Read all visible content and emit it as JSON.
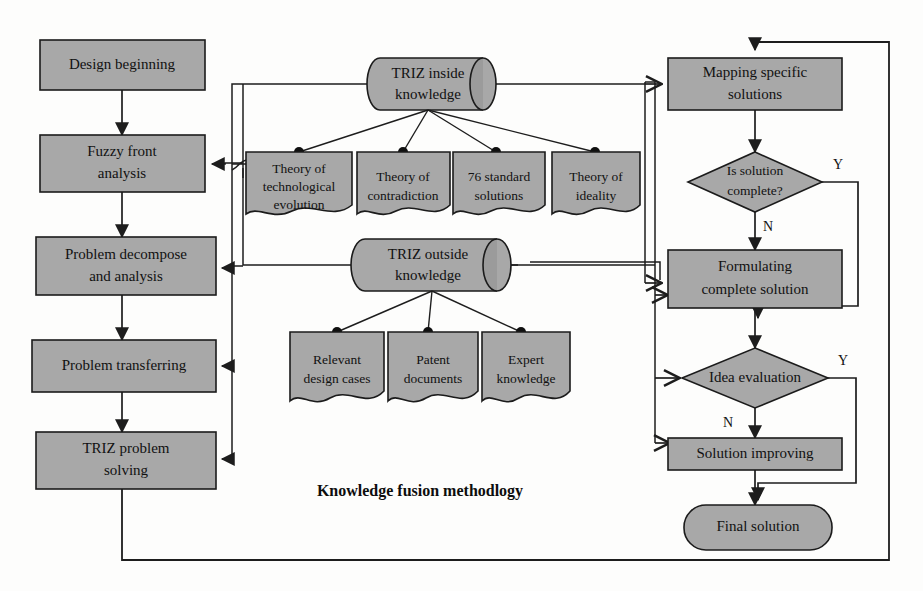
{
  "diagram": {
    "caption": "Knowledge fusion methodlogy",
    "colors": {
      "node_fill": "#a8a8a8",
      "stroke": "#1d1d1d",
      "page_background": "#fdfdfc",
      "text": "#111111"
    },
    "left_flow": {
      "name": "main-design-process",
      "steps": [
        {
          "id": "design-beginning",
          "label": "Design beginning",
          "shape": "rect"
        },
        {
          "id": "fuzzy-front-analysis",
          "label": "Fuzzy front analysis",
          "line1": "Fuzzy front",
          "line2": "analysis",
          "shape": "rect"
        },
        {
          "id": "problem-decompose",
          "label": "Problem decompose and analysis",
          "line1": "Problem decompose",
          "line2": "and analysis",
          "shape": "rect"
        },
        {
          "id": "problem-transferring",
          "label": "Problem transferring",
          "shape": "rect"
        },
        {
          "id": "triz-problem-solving",
          "label": "TRIZ problem solving",
          "line1": "TRIZ problem",
          "line2": "solving",
          "shape": "rect"
        }
      ]
    },
    "knowledge": {
      "inside": {
        "id": "triz-inside-knowledge",
        "label": "TRIZ inside knowledge",
        "line1": "TRIZ inside",
        "line2": "knowledge",
        "shape": "cylinder",
        "children": [
          {
            "id": "theory-of-technological-evolution",
            "line1": "Theory of",
            "line2": "technological",
            "line3": "evolution",
            "label": "Theory of technological evolution",
            "shape": "document"
          },
          {
            "id": "theory-of-contradiction",
            "line1": "Theory of",
            "line2": "contradiction",
            "line3": "",
            "label": "Theory of contradiction",
            "shape": "document"
          },
          {
            "id": "76-standard-solutions",
            "line1": "76 standard",
            "line2": "solutions",
            "line3": "",
            "label": "76 standard solutions",
            "shape": "document"
          },
          {
            "id": "theory-of-ideality",
            "line1": "Theory of",
            "line2": "ideality",
            "line3": "",
            "label": "Theory of ideality",
            "shape": "document"
          }
        ]
      },
      "outside": {
        "id": "triz-outside-knowledge",
        "label": "TRIZ outside knowledge",
        "line1": "TRIZ outside",
        "line2": "knowledge",
        "shape": "cylinder",
        "children": [
          {
            "id": "relevant-design-cases",
            "line1": "Relevant",
            "line2": "design cases",
            "label": "Relevant design cases",
            "shape": "document"
          },
          {
            "id": "patent-documents",
            "line1": "Patent",
            "line2": "documents",
            "label": "Patent documents",
            "shape": "document"
          },
          {
            "id": "expert-knowledge",
            "line1": "Expert",
            "line2": "knowledge",
            "label": "Expert knowledge",
            "shape": "document"
          }
        ]
      }
    },
    "right_flow": {
      "name": "solution-process",
      "steps": [
        {
          "id": "mapping-specific-solutions",
          "label": "Mapping specific solutions",
          "line1": "Mapping specific",
          "line2": "solutions",
          "shape": "rect"
        },
        {
          "id": "is-solution-complete",
          "label": "Is solution complete?",
          "line1": "Is solution",
          "line2": "complete?",
          "shape": "diamond",
          "yes_label": "Y",
          "no_label": "N"
        },
        {
          "id": "formulating-complete-solution",
          "label": "Formulating complete solution",
          "line1": "Formulating",
          "line2": "complete solution",
          "shape": "rect"
        },
        {
          "id": "idea-evaluation",
          "label": "Idea evaluation",
          "line1": "Idea evaluation",
          "line2": "",
          "shape": "diamond",
          "yes_label": "Y",
          "no_label": "N"
        },
        {
          "id": "solution-improving",
          "label": "Solution improving",
          "shape": "rect"
        },
        {
          "id": "final-solution",
          "label": "Final solution",
          "shape": "rounded"
        }
      ]
    }
  }
}
